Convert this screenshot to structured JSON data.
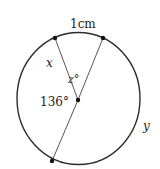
{
  "diagram": {
    "type": "circle-geometry",
    "labels": {
      "arc_length": "1cm",
      "chord_x": "x",
      "angle_z": "z°",
      "angle_136": "136°",
      "arc_y": "y"
    },
    "circle": {
      "cx": 78.5,
      "cy": 98.5,
      "rx": 61.5,
      "ry": 66
    },
    "center": {
      "x": 78,
      "y": 100
    },
    "points": {
      "top_left": {
        "x": 55,
        "y": 38
      },
      "top_right": {
        "x": 103,
        "y": 38
      },
      "bottom": {
        "x": 52,
        "y": 161
      }
    },
    "colors": {
      "stroke": "#2b2b2b",
      "text": "#222222"
    }
  }
}
